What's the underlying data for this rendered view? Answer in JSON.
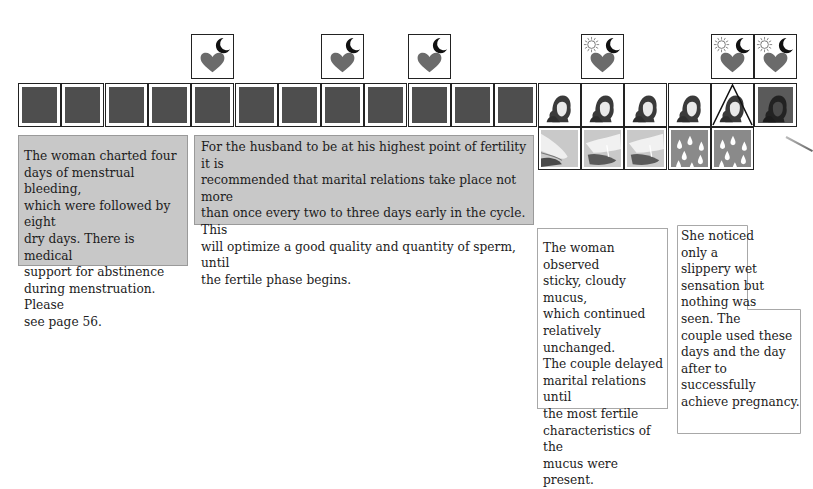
{
  "chart_data": {
    "type": "table",
    "days": 18,
    "day_markers": [
      {
        "day": 1,
        "type": "menstrual-bleeding"
      },
      {
        "day": 2,
        "type": "menstrual-bleeding"
      },
      {
        "day": 3,
        "type": "menstrual-bleeding"
      },
      {
        "day": 4,
        "type": "menstrual-bleeding"
      },
      {
        "day": 5,
        "type": "dry"
      },
      {
        "day": 6,
        "type": "dry"
      },
      {
        "day": 7,
        "type": "dry"
      },
      {
        "day": 8,
        "type": "dry"
      },
      {
        "day": 9,
        "type": "dry"
      },
      {
        "day": 10,
        "type": "dry"
      },
      {
        "day": 11,
        "type": "dry"
      },
      {
        "day": 12,
        "type": "dry"
      },
      {
        "day": 13,
        "type": "mucus-baby"
      },
      {
        "day": 14,
        "type": "mucus-baby"
      },
      {
        "day": 15,
        "type": "mucus-baby"
      },
      {
        "day": 16,
        "type": "mucus-baby"
      },
      {
        "day": 17,
        "type": "peak-baby"
      },
      {
        "day": 18,
        "type": "post-peak-baby"
      }
    ],
    "intercourse_days": [
      {
        "day": 5,
        "icon": "heart-moon"
      },
      {
        "day": 8,
        "icon": "heart-moon"
      },
      {
        "day": 10,
        "icon": "heart-moon"
      },
      {
        "day": 14,
        "icon": "heart-sun-moon"
      },
      {
        "day": 17,
        "icon": "heart-sun-moon"
      },
      {
        "day": 18,
        "icon": "heart-sun-moon"
      }
    ],
    "mucus_observations": [
      {
        "day": 13,
        "type": "sticky-cloudy-photo"
      },
      {
        "day": 14,
        "type": "sticky-cloudy-photo"
      },
      {
        "day": 15,
        "type": "sticky-cloudy-photo"
      },
      {
        "day": 16,
        "type": "slippery-drops"
      },
      {
        "day": 17,
        "type": "slippery-drops"
      }
    ]
  },
  "colors": {
    "dark_cell": "#4e4e4e",
    "heart": "#6b6b6b",
    "gray_note": "#c8c8c8",
    "drop_bg": "#8a8a8a"
  },
  "notes": {
    "note1": {
      "lines": [
        "The woman charted four",
        "days of menstrual bleeding,",
        "which were followed by eight",
        "dry days. There is medical",
        "support for abstinence",
        "during menstruation. Please",
        "see page 56."
      ]
    },
    "note2": {
      "lines": [
        "For the husband to be at his highest point of fertility it is",
        "recommended that marital relations take place not more",
        "than once every two to three days early in the cycle. This",
        "will optimize a good quality and quantity of sperm, until",
        "the fertile phase begins."
      ]
    },
    "note3": {
      "lines": [
        "The woman observed",
        "sticky, cloudy mucus,",
        "which continued",
        "relatively unchanged.",
        "The couple delayed",
        "marital relations until",
        "the most fertile",
        "characteristics of the",
        "mucus were present."
      ]
    },
    "note4": {
      "lines": [
        "She noticed",
        "only a",
        "slippery wet",
        "sensation but",
        "nothing was",
        "seen.  The",
        "couple used these",
        "days and the day",
        "after to successfully",
        "achieve pregnancy."
      ]
    }
  }
}
